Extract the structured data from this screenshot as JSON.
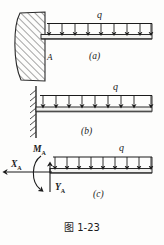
{
  "figure": {
    "caption": "图 1-23",
    "caption_label": "图",
    "caption_number": "1-23"
  },
  "diagrams": [
    {
      "id": "a",
      "part_label": "(a)",
      "load_label": "q",
      "point_label": "A",
      "support_type": "fixed-wall-solid-hatched",
      "arrow_count": 9,
      "arrow_direction": "down",
      "description": "Cantilever beam built into a solid hatched wall with uniformly distributed downward load q"
    },
    {
      "id": "b",
      "part_label": "(b)",
      "load_label": "q",
      "support_type": "fixed-support-hatch-line",
      "arrow_count": 9,
      "arrow_direction": "down",
      "description": "Schematic cantilever beam on hatched fixed support with uniformly distributed downward load q"
    },
    {
      "id": "c",
      "part_label": "(c)",
      "load_label": "q",
      "support_type": "free-body",
      "arrow_count": 9,
      "arrow_direction": "down",
      "reactions": [
        {
          "name": "moment-reaction",
          "label": "M",
          "subscript": "A",
          "kind": "moment",
          "sense": "curved"
        },
        {
          "name": "horizontal-reaction",
          "label": "X",
          "subscript": "A",
          "kind": "force",
          "sense": "left"
        },
        {
          "name": "vertical-reaction",
          "label": "Y",
          "subscript": "A",
          "kind": "force",
          "sense": "up"
        }
      ],
      "description": "Free body diagram of the cantilever beam showing reactions M_A, X_A and Y_A"
    }
  ],
  "colors": {
    "ink": "#1b1b1b",
    "line": "#2a2a2a",
    "hatch": "#3a3a3a",
    "background": "#fdfdfc",
    "beam_fill": "#f2f2f0"
  }
}
